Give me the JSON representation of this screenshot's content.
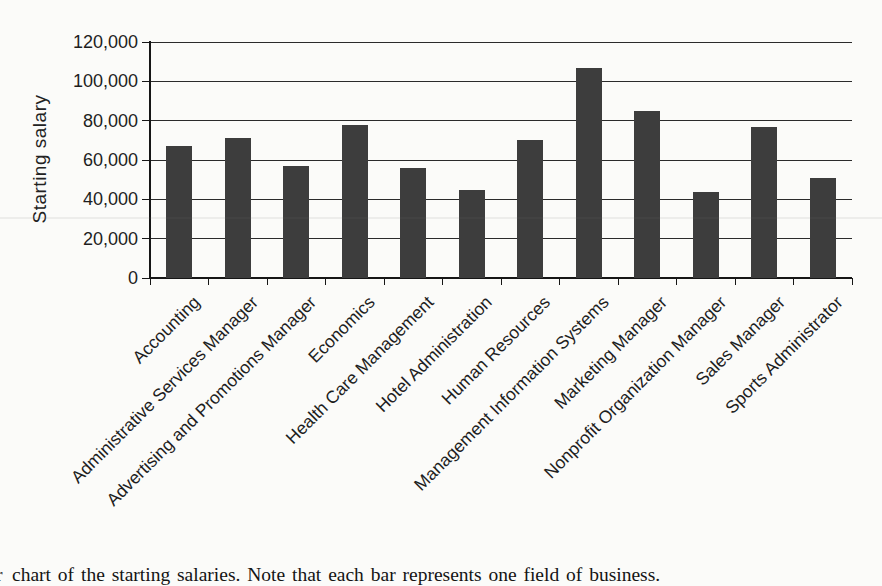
{
  "figure": {
    "ylabel": "Starting salary",
    "caption_cropped_prefix": "r",
    "caption": "chart of the starting salaries. Note that each bar represents one field of business."
  },
  "chart_data": {
    "type": "bar",
    "title": "",
    "xlabel": "",
    "ylabel": "Starting salary",
    "categories": [
      "Accounting",
      "Administrative Services Manager",
      "Advertising and Promotions Manager",
      "Economics",
      "Health Care Management",
      "Hotel Administration",
      "Human Resources",
      "Management Information Systems",
      "Marketing Manager",
      "Nonprofit Organization Manager",
      "Sales Manager",
      "Sports Administrator"
    ],
    "values": [
      67000,
      71000,
      57000,
      78000,
      56000,
      44500,
      70000,
      107000,
      85000,
      43500,
      77000,
      51000
    ],
    "ylim": [
      0,
      120000
    ],
    "yticks": [
      0,
      20000,
      40000,
      60000,
      80000,
      100000,
      120000
    ],
    "ytick_labels": [
      "0",
      "20,000",
      "40,000",
      "60,000",
      "80,000",
      "100,000",
      "120,000"
    ],
    "grid": true,
    "legend": false,
    "bar_color": "#3d3d3d",
    "x_label_rotation_deg": 45
  }
}
